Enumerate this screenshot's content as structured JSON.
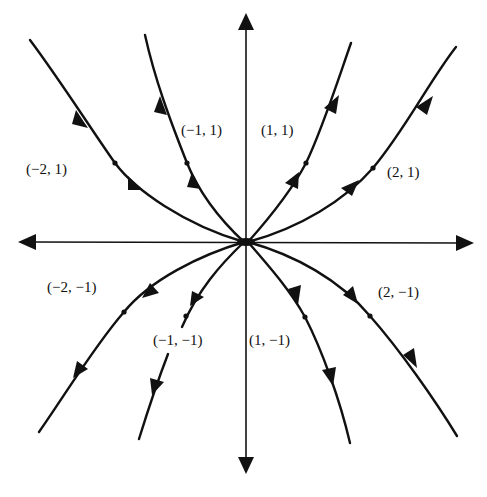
{
  "diagram": {
    "type": "phase-portrait",
    "origin": "unstable node",
    "axes": {
      "horizontal": "x-axis",
      "vertical": "y-axis"
    },
    "trajectories": [
      {
        "label": "(1, 1)",
        "quadrant": "I",
        "direction": "outward"
      },
      {
        "label": "(2, 1)",
        "quadrant": "I",
        "direction": "outward"
      },
      {
        "label": "(-1, 1)",
        "quadrant": "II",
        "direction": "outward"
      },
      {
        "label": "(-2, 1)",
        "quadrant": "II",
        "direction": "outward"
      },
      {
        "label": "(-1, -1)",
        "quadrant": "III",
        "direction": "outward"
      },
      {
        "label": "(-2, -1)",
        "quadrant": "III",
        "direction": "outward"
      },
      {
        "label": "(1, -1)",
        "quadrant": "IV",
        "direction": "outward"
      },
      {
        "label": "(2, -1)",
        "quadrant": "IV",
        "direction": "outward"
      }
    ]
  },
  "labels": {
    "p_m1_1": "(−1, 1)",
    "p_1_1": "(1, 1)",
    "p_m2_1": "(−2, 1)",
    "p_2_1": "(2, 1)",
    "p_m2_m1": "(−2, −1)",
    "p_2_m1": "(2, −1)",
    "p_m1_m1": "(−1, −1)",
    "p_1_m1": "(1, −1)"
  },
  "colors": {
    "ink": "#111111",
    "background": "#ffffff"
  }
}
